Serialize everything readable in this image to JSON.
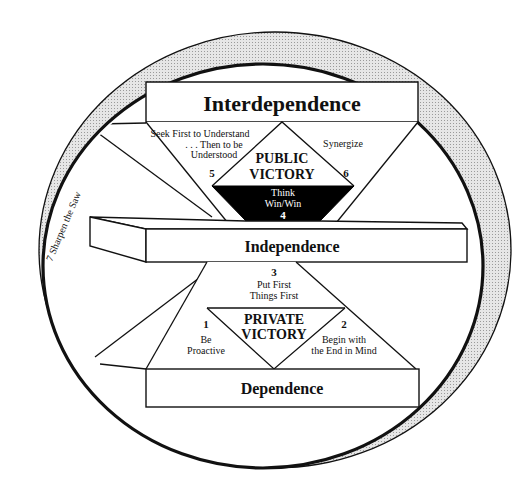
{
  "diagram": {
    "title_top": "Interdependence",
    "title_middle": "Independence",
    "title_bottom": "Dependence",
    "public_victory": {
      "line1": "PUBLIC",
      "line2": "VICTORY"
    },
    "private_victory": {
      "line1": "PRIVATE",
      "line2": "VICTORY"
    },
    "habits": [
      {
        "number": "1",
        "line1": "Be",
        "line2": "Proactive"
      },
      {
        "number": "2",
        "line1": "Begin with",
        "line2": "the End in Mind"
      },
      {
        "number": "3",
        "line1": "Put First",
        "line2": "Things First"
      },
      {
        "number": "4",
        "line1": "Think",
        "line2": "Win/Win"
      },
      {
        "number": "5",
        "line1": "Seek First to Understand",
        "line2": ". . . Then to be",
        "line3": "Understood"
      },
      {
        "number": "6",
        "line1": "Synergize"
      },
      {
        "number": "7",
        "line1": "Sharpen the Saw"
      }
    ],
    "ring_label": "7   Sharpen the Saw",
    "colors": {
      "ring_fill": "#d4d4d4",
      "stroke": "#111111",
      "background": "#ffffff",
      "win_win_fill": "#000000"
    }
  }
}
